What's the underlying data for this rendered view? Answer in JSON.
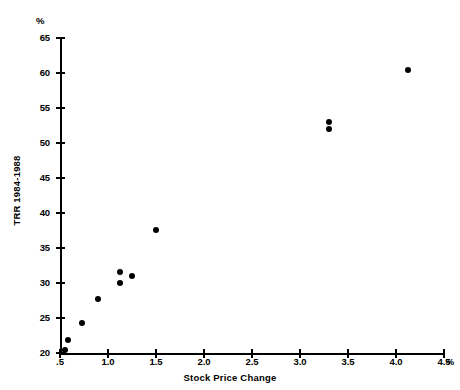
{
  "chart_data": {
    "type": "scatter",
    "title": "",
    "xlabel": "Stock Price Change",
    "ylabel": "TRR 1984-1988",
    "x_unit": "%",
    "y_unit": "%",
    "xlim": [
      0.5,
      4.5
    ],
    "ylim": [
      20,
      65
    ],
    "x_ticks": [
      0.5,
      1.0,
      1.5,
      2.0,
      2.5,
      3.0,
      3.5,
      4.0,
      4.5
    ],
    "x_tick_labels": [
      ".5",
      "1.0",
      "1.5",
      "2.0",
      "2.5",
      "3.0",
      "3.5",
      "4.0",
      "4.5"
    ],
    "y_ticks": [
      20,
      25,
      30,
      35,
      40,
      45,
      50,
      55,
      60,
      65
    ],
    "y_tick_labels": [
      "20",
      "25",
      "30",
      "35",
      "40",
      "45",
      "50",
      "55",
      "60",
      "65"
    ],
    "grid": false,
    "legend": false,
    "marker": "filled-circle",
    "marker_color": "#000000",
    "points": [
      {
        "x": 0.55,
        "y": 20.4
      },
      {
        "x": 0.58,
        "y": 21.9
      },
      {
        "x": 0.73,
        "y": 24.3
      },
      {
        "x": 0.9,
        "y": 27.7
      },
      {
        "x": 1.12,
        "y": 31.6
      },
      {
        "x": 1.13,
        "y": 30.0
      },
      {
        "x": 1.25,
        "y": 31.0
      },
      {
        "x": 1.5,
        "y": 37.6
      },
      {
        "x": 3.3,
        "y": 53.0
      },
      {
        "x": 3.3,
        "y": 52.0
      },
      {
        "x": 4.13,
        "y": 60.5
      }
    ]
  }
}
